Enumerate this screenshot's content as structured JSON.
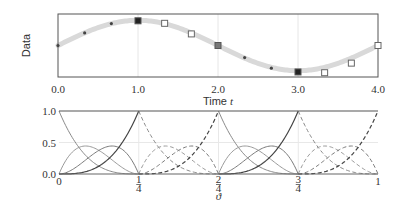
{
  "chart_data": [
    {
      "type": "scatter",
      "title": "",
      "xlabel": "Time t",
      "ylabel": "Data",
      "xlim": [
        0,
        4
      ],
      "ylim": [
        -1.25,
        1.25
      ],
      "grid": {
        "vertical": [
          1,
          2,
          3
        ],
        "horizontal": []
      },
      "xticks": [
        {
          "value": 0,
          "label": "0.0"
        },
        {
          "value": 1,
          "label": "1.0"
        },
        {
          "value": 2,
          "label": "2.0"
        },
        {
          "value": 3,
          "label": "3.0"
        },
        {
          "value": 4,
          "label": "4.0"
        }
      ],
      "yticks": [],
      "series": [
        {
          "name": "fitted-curve",
          "style": "thick-light-gray-line",
          "color": "#d9d9d9",
          "function": "sin(pi*t/2)"
        },
        {
          "name": "samples",
          "points": [
            {
              "t": 0.0,
              "y": 0.0,
              "marker": "dot"
            },
            {
              "t": 0.333,
              "y": 0.5,
              "marker": "dot"
            },
            {
              "t": 0.667,
              "y": 0.87,
              "marker": "dot"
            },
            {
              "t": 1.0,
              "y": 0.98,
              "marker": "filled-square"
            },
            {
              "t": 1.333,
              "y": 0.88,
              "marker": "open-square"
            },
            {
              "t": 1.667,
              "y": 0.46,
              "marker": "open-square"
            },
            {
              "t": 2.0,
              "y": 0.0,
              "marker": "gray-square"
            },
            {
              "t": 2.333,
              "y": -0.48,
              "marker": "dot"
            },
            {
              "t": 2.667,
              "y": -0.9,
              "marker": "dot"
            },
            {
              "t": 3.0,
              "y": -1.05,
              "marker": "filled-square"
            },
            {
              "t": 3.333,
              "y": -1.08,
              "marker": "open-square"
            },
            {
              "t": 3.667,
              "y": -0.7,
              "marker": "open-square"
            },
            {
              "t": 4.0,
              "y": 0.0,
              "marker": "open-square"
            }
          ]
        }
      ]
    },
    {
      "type": "line",
      "title": "",
      "xlabel": "ϑ",
      "ylabel": "",
      "xlim": [
        0,
        1
      ],
      "ylim": [
        0,
        1
      ],
      "grid": {
        "vertical": [
          0.25,
          0.5,
          0.75
        ],
        "horizontal": [
          0.5
        ]
      },
      "xticks": [
        {
          "value": 0,
          "label": "0"
        },
        {
          "value": 0.25,
          "num": "1",
          "den": "4"
        },
        {
          "value": 0.5,
          "num": "2",
          "den": "4"
        },
        {
          "value": 0.75,
          "num": "3",
          "den": "4"
        },
        {
          "value": 1,
          "label": "1"
        }
      ],
      "yticks": [
        {
          "value": 0,
          "label": "0.0"
        },
        {
          "value": 0.5,
          "label": "0.5"
        },
        {
          "value": 1,
          "label": "1.0"
        }
      ],
      "description": "Piecewise cubic Bernstein basis functions on 4 segments; segments 1 and 3 solid, segments 2 and 4 dashed",
      "segments": [
        {
          "range": [
            0,
            0.25
          ],
          "style": "solid"
        },
        {
          "range": [
            0.25,
            0.5
          ],
          "style": "dashed"
        },
        {
          "range": [
            0.5,
            0.75
          ],
          "style": "solid"
        },
        {
          "range": [
            0.75,
            1.0
          ],
          "style": "dashed"
        }
      ],
      "series": [
        {
          "name": "B0 (1-s)^3",
          "color": "#8a8a8a",
          "peak": 1.0
        },
        {
          "name": "B1 3s(1-s)^2",
          "color": "#9a9a9a",
          "peak": 0.444
        },
        {
          "name": "B2 3s^2(1-s)",
          "color": "#7a7a7a",
          "peak": 0.444
        },
        {
          "name": "B3 s^3",
          "color": "#444444",
          "peak": 1.0
        }
      ],
      "top_line": {
        "y": 1.0,
        "color": "#555555"
      }
    }
  ]
}
